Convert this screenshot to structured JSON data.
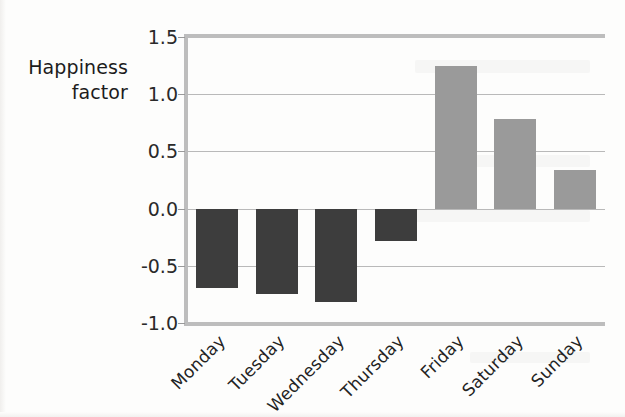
{
  "axis": {
    "ylabel_line1": "Happiness",
    "ylabel_line2": "factor",
    "yticks": [
      "1.5",
      "1.0",
      "0.5",
      "0.0",
      "-0.5",
      "-1.0"
    ]
  },
  "colors": {
    "negative_bar": "#3d3d3d",
    "positive_bar": "#9a9a9a",
    "gridline": "#b9b9b9",
    "spine": "#bdbdbd",
    "background": "#fdfdfc",
    "text": "#1c1c1c"
  },
  "chart_data": {
    "type": "bar",
    "title": "",
    "xlabel": "",
    "ylabel": "Happiness factor",
    "categories": [
      "Monday",
      "Tuesday",
      "Wednesday",
      "Thursday",
      "Friday",
      "Saturday",
      "Sunday"
    ],
    "values": [
      -0.69,
      -0.75,
      -0.82,
      -0.28,
      1.25,
      0.78,
      0.34
    ],
    "ylim": [
      -1.0,
      1.5
    ],
    "ytick_values": [
      1.5,
      1.0,
      0.5,
      0.0,
      -0.5,
      -1.0
    ],
    "grid": true,
    "grid_axis": "y",
    "legend": null,
    "bar_colors": [
      "#3d3d3d",
      "#3d3d3d",
      "#3d3d3d",
      "#3d3d3d",
      "#9a9a9a",
      "#9a9a9a",
      "#9a9a9a"
    ],
    "baseline": 0.0,
    "annotations": []
  }
}
